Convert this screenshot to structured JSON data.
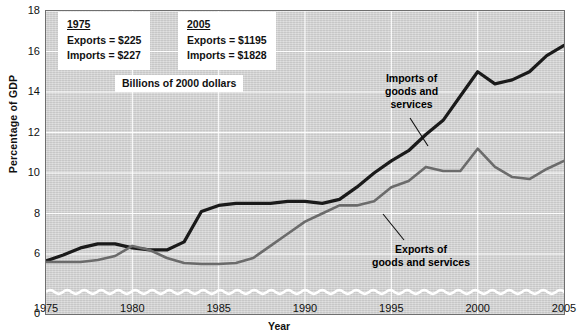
{
  "chart_data": {
    "type": "line",
    "title": "",
    "xlabel": "Year",
    "ylabel": "Percentage of GDP",
    "xlim": [
      1975,
      2005
    ],
    "ylim": [
      0,
      18
    ],
    "y_axis_break": true,
    "y_break_between": [
      0,
      6
    ],
    "grid": true,
    "yticks": [
      0,
      6,
      8,
      10,
      12,
      14,
      16,
      18
    ],
    "ytick_labels": [
      "0",
      "6",
      "8",
      "10",
      "12",
      "14",
      "16",
      "18"
    ],
    "xticks": [
      1975,
      1980,
      1985,
      1990,
      1995,
      2000,
      2005
    ],
    "xtick_labels": [
      "1975",
      "1980",
      "1985",
      "1990",
      "1995",
      "2000",
      "2005"
    ],
    "legend_position": "inline-callouts",
    "x": [
      1975,
      1976,
      1977,
      1978,
      1979,
      1980,
      1981,
      1982,
      1983,
      1984,
      1985,
      1986,
      1987,
      1988,
      1989,
      1990,
      1991,
      1992,
      1993,
      1994,
      1995,
      1996,
      1997,
      1998,
      1999,
      2000,
      2001,
      2002,
      2003,
      2004,
      2005
    ],
    "series": [
      {
        "name": "Imports of goods and services",
        "color": "#1a1a1a",
        "width": 3.2,
        "values": [
          5.3,
          5.9,
          6.3,
          6.5,
          6.5,
          6.3,
          6.2,
          6.2,
          6.6,
          8.1,
          8.4,
          8.5,
          8.5,
          8.5,
          8.6,
          8.6,
          8.5,
          8.7,
          9.3,
          10.0,
          10.6,
          11.1,
          11.9,
          12.6,
          13.8,
          15.0,
          14.4,
          14.6,
          15.0,
          15.8,
          16.3
        ]
      },
      {
        "name": "Exports of goods and services",
        "color": "#6b6b6b",
        "width": 2.6,
        "values": [
          5.2,
          5.2,
          5.2,
          5.4,
          5.8,
          6.4,
          6.2,
          5.6,
          5.1,
          5.0,
          5.0,
          5.1,
          5.6,
          6.4,
          7.0,
          7.6,
          8.0,
          8.4,
          8.4,
          8.6,
          9.3,
          9.6,
          10.3,
          10.1,
          10.1,
          11.2,
          10.3,
          9.8,
          9.7,
          10.2,
          10.6
        ]
      }
    ],
    "annotations": {
      "units_note": "Billions of 2000 dollars",
      "box_1975": {
        "title": "1975",
        "rows": [
          {
            "label": "Exports  =",
            "value": "$225"
          },
          {
            "label": "Imports  =",
            "value": "$227"
          }
        ]
      },
      "box_2005": {
        "title": "2005",
        "rows": [
          {
            "label": "Exports  =",
            "value": "$1195"
          },
          {
            "label": "Imports  =",
            "value": "$1828"
          }
        ]
      },
      "callout_imports": "Imports of\ngoods and\nservices",
      "callout_exports": "Exports of\ngoods and services"
    }
  }
}
